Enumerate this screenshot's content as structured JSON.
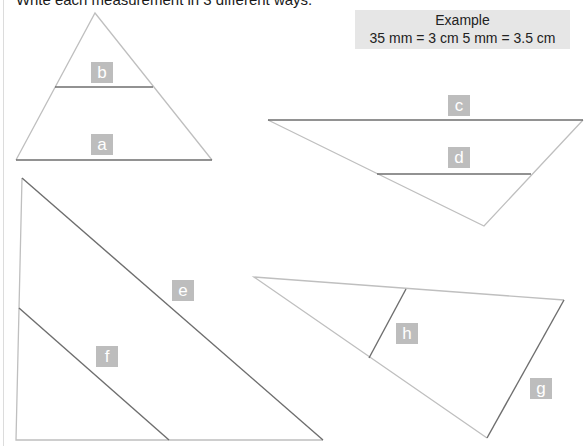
{
  "instruction": "Write each measurement in 3 different ways.",
  "example": {
    "title": "Example",
    "text": "35 mm = 3 cm 5 mm = 3.5 cm"
  },
  "colors": {
    "shape_outline": "#bfbfbf",
    "measure_line": "#6e6e6e",
    "label_bg": "#bdbdbd",
    "label_text": "#ffffff",
    "example_bg": "#e6e6e6"
  },
  "labels": {
    "a": "a",
    "b": "b",
    "c": "c",
    "d": "d",
    "e": "e",
    "f": "f",
    "g": "g",
    "h": "h"
  }
}
